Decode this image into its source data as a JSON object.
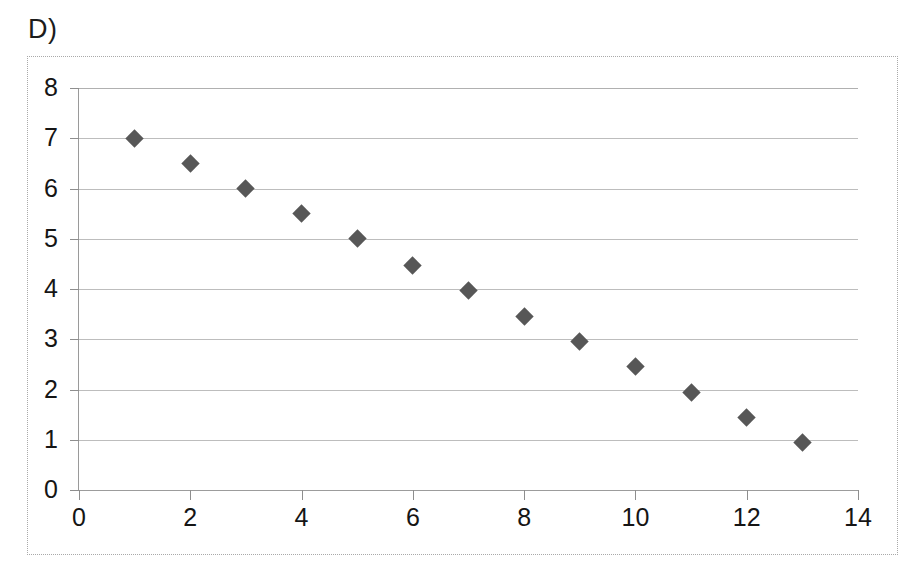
{
  "panel": {
    "letter": "D)"
  },
  "colors": {
    "marker": "#575757",
    "gridline": "#bdbdbd",
    "axis": "#9a9a9a",
    "frame_border": "#a9a9a9",
    "text": "#151515",
    "background": "#ffffff"
  },
  "chart_data": {
    "type": "scatter",
    "title": "D)",
    "xlabel": "",
    "ylabel": "",
    "xlim": [
      0,
      14
    ],
    "ylim": [
      0,
      8
    ],
    "xticks": [
      0,
      2,
      4,
      6,
      8,
      10,
      12,
      14
    ],
    "xtick_labels": [
      "0",
      "2",
      "4",
      "6",
      "8",
      "10",
      "12",
      "14"
    ],
    "yticks": [
      0,
      1,
      2,
      3,
      4,
      5,
      6,
      7,
      8
    ],
    "ytick_labels": [
      "0",
      "1",
      "2",
      "3",
      "4",
      "5",
      "6",
      "7",
      "8"
    ],
    "grid": "horizontal",
    "legend": null,
    "marker": "diamond",
    "marker_color": "#575757",
    "marker_size": 18,
    "series": [
      {
        "name": "series-1",
        "x": [
          1,
          2,
          3,
          4,
          5,
          6,
          7,
          8,
          9,
          10,
          11,
          12,
          13
        ],
        "y": [
          7.0,
          6.5,
          6.0,
          5.5,
          5.0,
          4.47,
          3.97,
          3.46,
          2.96,
          2.45,
          1.95,
          1.44,
          0.94
        ],
        "points": [
          {
            "x": 1,
            "y": 7.0
          },
          {
            "x": 2,
            "y": 6.5
          },
          {
            "x": 3,
            "y": 6.0
          },
          {
            "x": 4,
            "y": 5.5
          },
          {
            "x": 5,
            "y": 5.0
          },
          {
            "x": 6,
            "y": 4.47
          },
          {
            "x": 7,
            "y": 3.97
          },
          {
            "x": 8,
            "y": 3.46
          },
          {
            "x": 9,
            "y": 2.96
          },
          {
            "x": 10,
            "y": 2.45
          },
          {
            "x": 11,
            "y": 1.95
          },
          {
            "x": 12,
            "y": 1.44
          },
          {
            "x": 13,
            "y": 0.94
          }
        ]
      }
    ]
  }
}
